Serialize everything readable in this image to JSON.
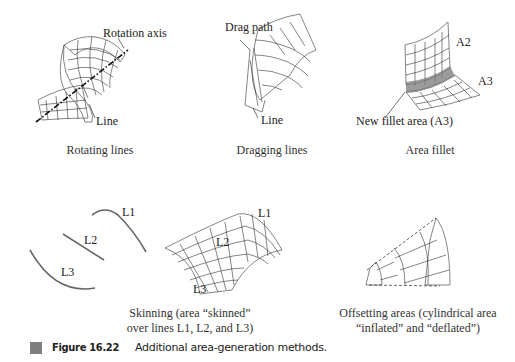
{
  "panels": {
    "rotating": {
      "labels": {
        "axis": "Rotation axis",
        "line": "Line"
      },
      "caption": "Rotating lines"
    },
    "dragging": {
      "labels": {
        "path": "Drag path",
        "line": "Line"
      },
      "caption": "Dragging lines"
    },
    "fillet": {
      "labels": {
        "a2": "A2",
        "a3": "A3",
        "new_area": "New fillet area (A3)"
      },
      "caption": "Area fillet"
    },
    "skinning": {
      "lines_labels": {
        "l1": "L1",
        "l2": "L2",
        "l3": "L3"
      },
      "surface_labels": {
        "l1": "L1",
        "l2": "L2",
        "l3": "L3"
      },
      "caption_line1": "Skinning (area “skinned”",
      "caption_line2": "over lines L1, L2, and L3)"
    },
    "offsetting": {
      "caption_line1": "Offsetting areas (cylindrical area",
      "caption_line2": "“inflated” and “deflated”)"
    }
  },
  "figure": {
    "number": "Figure 16.22",
    "title": "Additional area-generation methods.",
    "marker_color": "#7f7f7f"
  }
}
